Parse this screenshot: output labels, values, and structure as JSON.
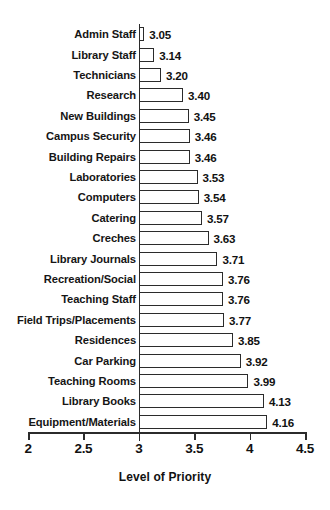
{
  "chart_data": {
    "type": "bar",
    "orientation": "horizontal",
    "title": "",
    "xlabel": "Level of Priority",
    "ylabel": "",
    "xlim": [
      2,
      4.5
    ],
    "xticks": [
      "2",
      "2.5",
      "3",
      "3.5",
      "4",
      "4.5"
    ],
    "xtick_values": [
      2,
      2.5,
      3,
      3.5,
      4,
      4.5
    ],
    "baseline": 3,
    "grid": false,
    "legend": false,
    "bar_fill_color": "#ffffff",
    "bar_edge_color": "#2b2b2b",
    "categories": [
      "Admin Staff",
      "Library Staff",
      "Technicians",
      "Research",
      "New Buildings",
      "Campus Security",
      "Building Repairs",
      "Laboratories",
      "Computers",
      "Catering",
      "Creches",
      "Library Journals",
      "Recreation/Social",
      "Teaching Staff",
      "Field Trips/Placements",
      "Residences",
      "Car Parking",
      "Teaching Rooms",
      "Library Books",
      "Equipment/Materials"
    ],
    "values": [
      3.05,
      3.14,
      3.2,
      3.4,
      3.45,
      3.46,
      3.46,
      3.53,
      3.54,
      3.57,
      3.63,
      3.71,
      3.76,
      3.76,
      3.77,
      3.85,
      3.92,
      3.99,
      4.13,
      4.16
    ],
    "value_labels": [
      "3.05",
      "3.14",
      "3.20",
      "3.40",
      "3.45",
      "3.46",
      "3.46",
      "3.53",
      "3.54",
      "3.57",
      "3.63",
      "3.71",
      "3.76",
      "3.76",
      "3.77",
      "3.85",
      "3.92",
      "3.99",
      "4.13",
      "4.16"
    ]
  }
}
